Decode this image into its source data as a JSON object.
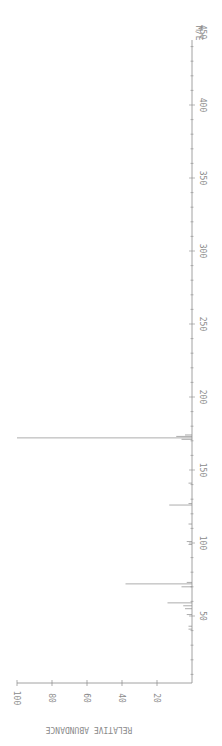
{
  "chart_data": {
    "type": "bar",
    "title": "",
    "orientation": "rotated-90-clockwise",
    "xlabel": "M/E",
    "ylabel": "RELATIVE ABUNDANCE",
    "xlim": [
      0,
      470
    ],
    "ylim": [
      0,
      100
    ],
    "x_ticks": [
      50,
      100,
      150,
      200,
      250,
      300,
      350,
      400,
      450
    ],
    "y_ticks": [
      20,
      40,
      60,
      80,
      100
    ],
    "grid": false,
    "legend": null,
    "peaks": [
      {
        "mz": 41,
        "intensity": 2
      },
      {
        "mz": 43,
        "intensity": 2
      },
      {
        "mz": 51,
        "intensity": 3
      },
      {
        "mz": 55,
        "intensity": 4
      },
      {
        "mz": 57,
        "intensity": 5
      },
      {
        "mz": 59,
        "intensity": 14
      },
      {
        "mz": 70,
        "intensity": 6
      },
      {
        "mz": 72,
        "intensity": 38
      },
      {
        "mz": 73,
        "intensity": 3
      },
      {
        "mz": 99,
        "intensity": 2
      },
      {
        "mz": 101,
        "intensity": 3
      },
      {
        "mz": 113,
        "intensity": 2
      },
      {
        "mz": 126,
        "intensity": 13
      },
      {
        "mz": 127,
        "intensity": 2
      },
      {
        "mz": 141,
        "intensity": 2
      },
      {
        "mz": 171,
        "intensity": 6
      },
      {
        "mz": 172,
        "intensity": 100
      },
      {
        "mz": 173,
        "intensity": 9
      },
      {
        "mz": 174,
        "intensity": 4
      }
    ]
  },
  "axis": {
    "x_label": "M/E",
    "y_label": "RELATIVE ABUNDANCE"
  },
  "colors": {
    "background": "#ffffff",
    "ink": "#8a8a8a"
  }
}
